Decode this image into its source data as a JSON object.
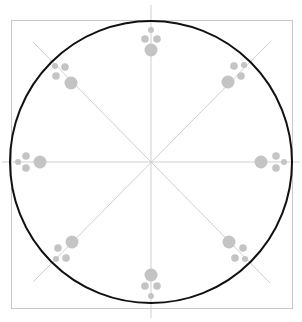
{
  "diagram": {
    "type": "radial-symmetric-pattern",
    "width": 302,
    "height": 322,
    "background": "#ffffff",
    "frame": {
      "x": 11,
      "y": 20,
      "width": 281,
      "height": 288,
      "stroke": "#c8c8c8",
      "stroke_width": 1
    },
    "circle": {
      "cx": 151,
      "cy": 162,
      "r": 141,
      "stroke": "#111111",
      "stroke_width": 2
    },
    "axis_color": "#cfcfcf",
    "axes": [
      {
        "name": "vertical",
        "x1": 151,
        "y1": 5,
        "x2": 151,
        "y2": 318
      },
      {
        "name": "horizontal",
        "x1": 2,
        "y1": 162,
        "x2": 300,
        "y2": 162
      },
      {
        "name": "diagonal-down",
        "x1": 33,
        "y1": 42,
        "x2": 270,
        "y2": 283
      },
      {
        "name": "diagonal-up",
        "x1": 33,
        "y1": 282,
        "x2": 270,
        "y2": 42
      }
    ],
    "dot_color": "#c4c4c4",
    "dot_color_dark": "#a8a8a8",
    "clusters": [
      {
        "name": "top",
        "dots": [
          {
            "cx": 151,
            "cy": 30,
            "r": 3
          },
          {
            "cx": 145,
            "cy": 39,
            "r": 3.8
          },
          {
            "cx": 157,
            "cy": 39,
            "r": 3.8
          },
          {
            "cx": 151,
            "cy": 50,
            "r": 6.5
          }
        ]
      },
      {
        "name": "bottom",
        "dots": [
          {
            "cx": 151,
            "cy": 296,
            "r": 3
          },
          {
            "cx": 145,
            "cy": 286,
            "r": 3.8
          },
          {
            "cx": 157,
            "cy": 286,
            "r": 3.8
          },
          {
            "cx": 151,
            "cy": 275,
            "r": 6.5
          }
        ]
      },
      {
        "name": "left",
        "dots": [
          {
            "cx": 18,
            "cy": 162,
            "r": 3
          },
          {
            "cx": 26,
            "cy": 156,
            "r": 3.8
          },
          {
            "cx": 26,
            "cy": 168,
            "r": 3.8
          },
          {
            "cx": 40,
            "cy": 162,
            "r": 6.5
          }
        ]
      },
      {
        "name": "right",
        "dots": [
          {
            "cx": 284,
            "cy": 162,
            "r": 3
          },
          {
            "cx": 276,
            "cy": 156,
            "r": 3.8
          },
          {
            "cx": 276,
            "cy": 168,
            "r": 3.8
          },
          {
            "cx": 261,
            "cy": 162,
            "r": 6.5
          }
        ]
      },
      {
        "name": "top-left",
        "dots": [
          {
            "cx": 55,
            "cy": 66,
            "r": 3
          },
          {
            "cx": 65,
            "cy": 67,
            "r": 3.8
          },
          {
            "cx": 56,
            "cy": 76,
            "r": 3.8
          },
          {
            "cx": 71,
            "cy": 83,
            "r": 6.5
          }
        ]
      },
      {
        "name": "top-right",
        "dots": [
          {
            "cx": 244,
            "cy": 65,
            "r": 3
          },
          {
            "cx": 234,
            "cy": 66,
            "r": 3.8
          },
          {
            "cx": 241,
            "cy": 76,
            "r": 3.8
          },
          {
            "cx": 228,
            "cy": 82,
            "r": 6.5
          }
        ]
      },
      {
        "name": "bottom-left",
        "dots": [
          {
            "cx": 56,
            "cy": 259,
            "r": 3
          },
          {
            "cx": 58,
            "cy": 248,
            "r": 3.8
          },
          {
            "cx": 66,
            "cy": 258,
            "r": 3.8
          },
          {
            "cx": 72,
            "cy": 242,
            "r": 6.5
          }
        ]
      },
      {
        "name": "bottom-right",
        "dots": [
          {
            "cx": 245,
            "cy": 259,
            "r": 3
          },
          {
            "cx": 243,
            "cy": 248,
            "r": 3.8
          },
          {
            "cx": 235,
            "cy": 258,
            "r": 3.8
          },
          {
            "cx": 229,
            "cy": 242,
            "r": 6.5
          }
        ]
      }
    ]
  }
}
